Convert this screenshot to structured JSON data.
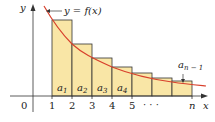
{
  "diagram": {
    "curve_label": "y = f(x)",
    "axis_x_label": "x",
    "axis_y_label": "y",
    "origin_label": "0",
    "x_ticks": [
      "1",
      "2",
      "3",
      "4",
      "5",
      "n"
    ],
    "ellipsis": "· · ·",
    "rect_labels": [
      {
        "base": "a",
        "sub": "1"
      },
      {
        "base": "a",
        "sub": "2"
      },
      {
        "base": "a",
        "sub": "3"
      },
      {
        "base": "a",
        "sub": "4"
      }
    ],
    "last_label": {
      "base": "a",
      "sub": "n − 1"
    },
    "colors": {
      "rect_fill": "#f9e6a6",
      "rect_stroke": "#333333",
      "curve": "#d8402c",
      "axis": "#333333"
    }
  }
}
